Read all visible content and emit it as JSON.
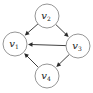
{
  "diagram": {
    "type": "directed-graph",
    "nodes": [
      {
        "id": "v1",
        "label": "v",
        "subscript": "1"
      },
      {
        "id": "v2",
        "label": "v",
        "subscript": "2"
      },
      {
        "id": "v3",
        "label": "v",
        "subscript": "3"
      },
      {
        "id": "v4",
        "label": "v",
        "subscript": "4"
      }
    ],
    "edges": [
      {
        "from": "v2",
        "to": "v1"
      },
      {
        "from": "v2",
        "to": "v3"
      },
      {
        "from": "v3",
        "to": "v1"
      },
      {
        "from": "v3",
        "to": "v4"
      },
      {
        "from": "v4",
        "to": "v1"
      }
    ],
    "colors": {
      "edge": "#2b2b2b",
      "node_border": "#8a8a8a",
      "background": "#ffffff"
    }
  }
}
